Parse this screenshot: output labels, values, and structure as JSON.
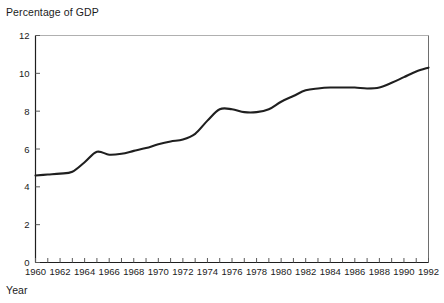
{
  "chart_data": {
    "type": "line",
    "title": "",
    "xlabel": "Year",
    "ylabel": "Percentage of GDP",
    "xlim": [
      1960,
      1992
    ],
    "ylim": [
      0,
      12
    ],
    "yticks": [
      0,
      2,
      4,
      6,
      8,
      10,
      12
    ],
    "xticks": [
      1960,
      1961,
      1962,
      1963,
      1964,
      1965,
      1966,
      1967,
      1968,
      1969,
      1970,
      1971,
      1972,
      1973,
      1974,
      1975,
      1976,
      1977,
      1978,
      1979,
      1980,
      1981,
      1982,
      1983,
      1984,
      1985,
      1986,
      1987,
      1988,
      1989,
      1990,
      1991,
      1992
    ],
    "xtick_labels": [
      "1960",
      "",
      "1962",
      "",
      "1964",
      "",
      "1966",
      "",
      "1968",
      "",
      "1970",
      "",
      "1972",
      "",
      "1974",
      "",
      "1976",
      "",
      "1978",
      "",
      "1980",
      "",
      "1982",
      "",
      "1984",
      "",
      "1986",
      "",
      "1988",
      "",
      "1990",
      "",
      "1992"
    ],
    "grid": false,
    "legend": false,
    "line_color": "#1f1f1f",
    "line_width": 2.1,
    "series": [
      {
        "name": "Percentage of GDP",
        "x": [
          1960,
          1961,
          1962,
          1963,
          1964,
          1965,
          1966,
          1967,
          1968,
          1969,
          1970,
          1971,
          1972,
          1973,
          1974,
          1975,
          1976,
          1977,
          1978,
          1979,
          1980,
          1981,
          1982,
          1983,
          1984,
          1985,
          1986,
          1987,
          1988,
          1989,
          1990,
          1991,
          1992
        ],
        "values": [
          4.6,
          4.65,
          4.7,
          4.8,
          5.3,
          5.85,
          5.7,
          5.75,
          5.9,
          6.05,
          6.25,
          6.4,
          6.5,
          6.8,
          7.5,
          8.1,
          8.1,
          7.95,
          7.95,
          8.1,
          8.5,
          8.8,
          9.1,
          9.2,
          9.25,
          9.25,
          9.25,
          9.2,
          9.25,
          9.5,
          9.8,
          10.1,
          10.3
        ]
      }
    ]
  },
  "axes": {
    "y_title": "Percentage of GDP",
    "x_title": "Year"
  }
}
